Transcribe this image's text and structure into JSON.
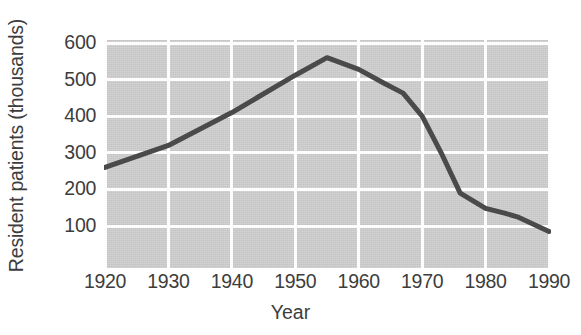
{
  "chart_data": {
    "type": "line",
    "title": "",
    "xlabel": "Year",
    "ylabel": "Resident patients (thousands)",
    "xlim": [
      1920,
      1990
    ],
    "ylim": [
      0,
      640
    ],
    "xticks": [
      1920,
      1930,
      1940,
      1950,
      1960,
      1970,
      1980,
      1990
    ],
    "yticks": [
      100,
      200,
      300,
      400,
      500,
      600
    ],
    "xtick_labels": [
      "1920",
      "1930",
      "1940",
      "1950",
      "1960",
      "1970",
      "1980",
      "1990"
    ],
    "ytick_labels": [
      "100",
      "200",
      "300",
      "400",
      "500",
      "600"
    ],
    "grid": true,
    "grid_color": "#fdfdfd",
    "plot_background": "#c9c9c9",
    "legend": null,
    "series": [
      {
        "name": "Resident patients",
        "color": "#4a4a4a",
        "line_width": 5,
        "x": [
          1920,
          1930,
          1940,
          1950,
          1955,
          1960,
          1964,
          1967,
          1970,
          1973,
          1976,
          1980,
          1983,
          1985,
          1990
        ],
        "values": [
          260,
          320,
          410,
          512,
          560,
          528,
          490,
          463,
          400,
          300,
          190,
          148,
          135,
          125,
          85
        ]
      }
    ]
  },
  "axes": {
    "y_title": "Resident patients (thousands)",
    "x_title": "Year"
  }
}
